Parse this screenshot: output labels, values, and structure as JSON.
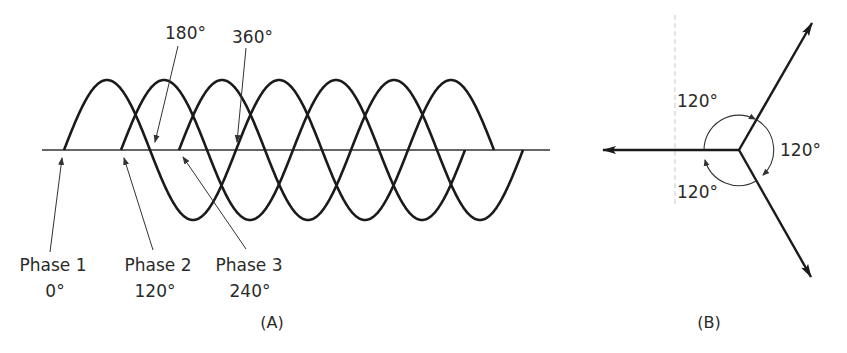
{
  "figure": {
    "panel_a": {
      "caption": "(A)",
      "annotations": {
        "deg_180": "180°",
        "deg_360": "360°"
      },
      "phases": [
        {
          "name": "Phase 1",
          "angle": "0°"
        },
        {
          "name": "Phase 2",
          "angle": "120°"
        },
        {
          "name": "Phase 3",
          "angle": "240°"
        }
      ]
    },
    "panel_b": {
      "caption": "(B)",
      "angle_labels": [
        "120°",
        "120°",
        "120°"
      ]
    },
    "colors": {
      "line": "#1a1a1a",
      "thin_line": "#444444",
      "text": "#2a2a2a",
      "background": "#ffffff"
    }
  },
  "waveforms": {
    "axis": {
      "y": 150,
      "x_start": 42,
      "x_end": 550
    },
    "amplitude_px": 70,
    "half_period_px": 86,
    "series": [
      {
        "name": "Phase 1",
        "phase_deg": 0,
        "start_x": 64,
        "half_cycles": 5
      },
      {
        "name": "Phase 2",
        "phase_deg": 120,
        "start_x": 121,
        "half_cycles": 4
      },
      {
        "name": "Phase 3",
        "phase_deg": 240,
        "start_x": 179,
        "half_cycles": 4
      }
    ]
  },
  "phasors": {
    "center": [
      739,
      150
    ],
    "vectors_deg": [
      180,
      60,
      -60
    ],
    "separation_deg": 120
  }
}
